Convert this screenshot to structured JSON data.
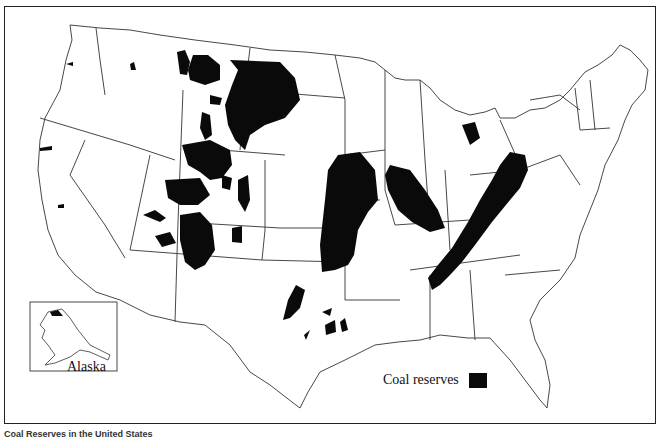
{
  "map": {
    "title": "Coal reserves of the United States",
    "region": "Contiguous United States",
    "inset": {
      "label": "Alaska"
    },
    "legend": {
      "label": "Coal reserves",
      "swatch_color": "#0a0a0a"
    },
    "colors": {
      "land": "#ffffff",
      "border": "#333333",
      "coal": "#0a0a0a"
    }
  },
  "caption": {
    "text": "Coal Reserves in the United States"
  }
}
